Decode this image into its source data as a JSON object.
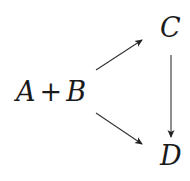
{
  "diagram": {
    "type": "reaction-scheme",
    "nodes": [
      {
        "id": "reactants",
        "label_left": "A",
        "operator": "+",
        "label_right": "B"
      },
      {
        "id": "C",
        "label": "C"
      },
      {
        "id": "D",
        "label": "D"
      }
    ],
    "edges": [
      {
        "from": "reactants",
        "to": "C"
      },
      {
        "from": "reactants",
        "to": "D"
      },
      {
        "from": "C",
        "to": "D"
      }
    ],
    "colors": {
      "stroke": "#333333",
      "text": "#1a1a1a",
      "background": "#ffffff"
    }
  }
}
